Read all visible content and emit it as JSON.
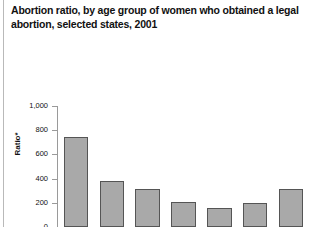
{
  "chart_data": {
    "type": "bar",
    "title": "Abortion ratio, by age group of women who obtained a legal abortion, selected states, 2001",
    "title_lines": [
      "Abortion ratio, by age group of women who obtained a legal",
      "abortion, selected states, 2001"
    ],
    "xlabel": "Age group (years)",
    "ylabel": "Ratio*",
    "categories": [
      "<15",
      "15–19",
      "20–24",
      "25–29",
      "30–34",
      "35–39",
      "≥40"
    ],
    "values": [
      745,
      377,
      312,
      210,
      158,
      198,
      318
    ],
    "ylim": [
      0,
      1000
    ],
    "yticks": [
      0,
      200,
      400,
      600,
      800,
      1000
    ],
    "ytick_labels": [
      "0",
      "200",
      "400",
      "600",
      "800",
      "1,000"
    ],
    "grid": false,
    "legend": null,
    "bar_color": "#a9a9a9",
    "bar_border_color": "#555555",
    "axis_color": "#9a9a9a",
    "background": "#ffffff"
  }
}
